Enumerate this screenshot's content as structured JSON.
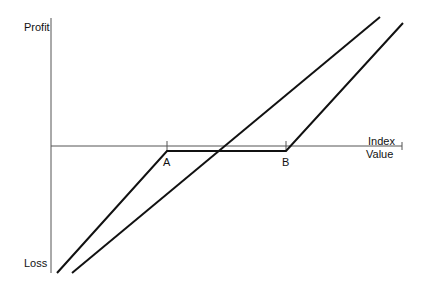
{
  "diagram": {
    "type": "payoff-diagram",
    "y_axis": {
      "top_label": "Profit",
      "bottom_label": "Loss"
    },
    "x_axis": {
      "label_line1": "Index",
      "label_line2": "Value"
    },
    "points": [
      {
        "name": "A",
        "label": "A"
      },
      {
        "name": "B",
        "label": "B"
      }
    ],
    "lines": [
      {
        "name": "piecewise-payoff",
        "description": "rises to A, flat between A and B slightly below axis, rises after B",
        "vertices": [
          [
            57,
            273
          ],
          [
            167,
            151
          ],
          [
            286,
            151
          ],
          [
            403,
            23
          ]
        ]
      },
      {
        "name": "linear-payoff",
        "description": "straight rising line",
        "vertices": [
          [
            72,
            273
          ],
          [
            380,
            17
          ]
        ]
      }
    ],
    "colors": {
      "axis": "#555555",
      "line": "#111111"
    }
  }
}
